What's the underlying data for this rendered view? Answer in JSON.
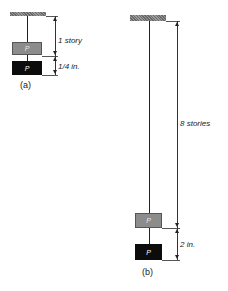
{
  "figure_a": {
    "weight_top_label": "P",
    "weight_bottom_label": "P",
    "dimension_upper": "1 story",
    "dimension_lower": "1/4 in.",
    "caption": "(a)"
  },
  "figure_b": {
    "weight_top_label": "P",
    "weight_bottom_label": "P",
    "dimension_upper": "8 stories",
    "dimension_lower": "2 in.",
    "caption": "(b)"
  },
  "colors": {
    "ceiling": "#7a7a7a",
    "weight_top": "#8c8c8c",
    "weight_bottom": "#0c0c0c",
    "line": "#222222"
  }
}
